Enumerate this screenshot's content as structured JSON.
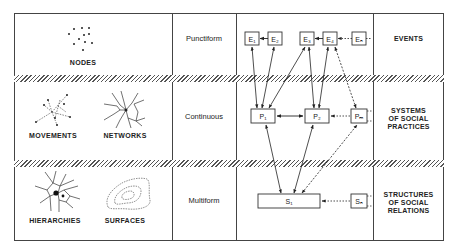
{
  "left_column": {
    "row1": [
      "NODES"
    ],
    "row2": [
      "MOVEMENTS",
      "NETWORKS"
    ],
    "row3": [
      "HIERARCHIES",
      "SURFACES"
    ]
  },
  "middle_column": {
    "row1": "Punctiform",
    "row2": "Continuous",
    "row3": "Multiform"
  },
  "diagram": {
    "events": [
      "E₁",
      "E₂",
      "E₃",
      "E₄",
      "Eₙ"
    ],
    "practices": [
      "P₁",
      "P₂",
      "Pₘ"
    ],
    "structures": [
      "S₁",
      "Sₙ"
    ]
  },
  "right_column": {
    "row1": "EVENTS",
    "row2": [
      "SYSTEMS",
      "OF SOCIAL",
      "PRACTICES"
    ],
    "row3": [
      "STRUCTURES",
      "OF SOCIAL",
      "RELATIONS"
    ]
  }
}
